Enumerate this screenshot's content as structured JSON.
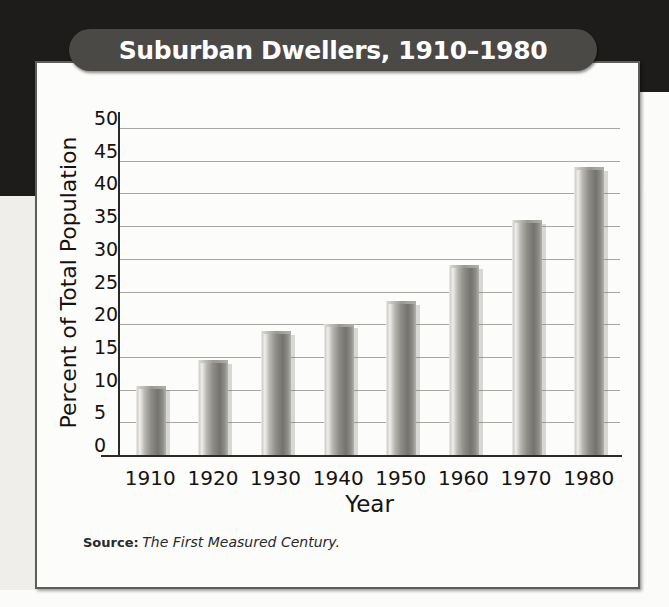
{
  "figure": {
    "title": "Suburban Dwellers, 1910–1980",
    "source_label": "Source:",
    "source_reference": "The First Measured Century.",
    "accent_title_bg": "#4a4946",
    "bar_color": "#8e8c87",
    "grid_color": "#a8a7a3",
    "axis_color": "#2b2a28",
    "card_bg": "#fcfcfb",
    "page_bg_dark": "#1d1c1a"
  },
  "chart_data": {
    "type": "bar",
    "title": "Suburban Dwellers, 1910–1980",
    "xlabel": "Year",
    "ylabel": "Percent of Total Population",
    "categories": [
      "1910",
      "1920",
      "1930",
      "1940",
      "1950",
      "1960",
      "1970",
      "1980"
    ],
    "values": [
      10.5,
      14.5,
      19.0,
      20.0,
      23.5,
      29.0,
      36.0,
      44.0
    ],
    "ylim": [
      0,
      50
    ],
    "yticks": [
      "50",
      "45",
      "40",
      "35",
      "30",
      "25",
      "20",
      "15",
      "10",
      "5",
      "0"
    ],
    "ytick_values": [
      50,
      45,
      40,
      35,
      30,
      25,
      20,
      15,
      10,
      5,
      0
    ],
    "grid": true,
    "legend": false,
    "legend_position": "none",
    "units": "percent"
  }
}
